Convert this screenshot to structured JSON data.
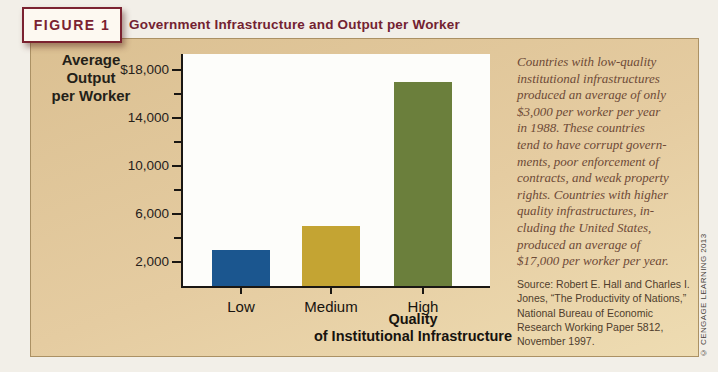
{
  "header": {
    "badge": "FIGURE 1",
    "title": "Government Infrastructure and Output per Worker"
  },
  "chart_data": {
    "type": "bar",
    "title": "Government Infrastructure and Output per Worker",
    "categories": [
      "Low",
      "Medium",
      "High"
    ],
    "values": [
      3000,
      5000,
      17000
    ],
    "bar_colors": [
      "#1b568f",
      "#c4a433",
      "#6b7f3c"
    ],
    "ylabel": "Average Output per Worker",
    "ylabel_lines": [
      "Average",
      "Output",
      "per Worker"
    ],
    "xlabel": "Quality of Institutional Infrastructure",
    "xlabel_lines": [
      "Quality",
      "of Institutional Infrastructure"
    ],
    "ylim": [
      0,
      19300
    ],
    "yticks_major": [
      18000,
      14000,
      10000,
      6000,
      2000
    ],
    "ytick_labels": [
      "$18,000",
      "14,000",
      "10,000",
      "6,000",
      "2,000"
    ],
    "yticks_minor": [
      16000,
      12000,
      8000,
      4000
    ],
    "grid": false,
    "legend": "none"
  },
  "note": {
    "lines": [
      "Countries with low-quality",
      "institutional infrastructures",
      "produced an average of only",
      "$3,000 per worker per year",
      "in 1988. These countries",
      "tend to have corrupt govern-",
      "ments, poor enforcement of",
      "contracts, and weak property",
      "rights. Countries with higher",
      "quality infrastructures, in-",
      "cluding the United States,",
      "produced an average of",
      "$17,000 per worker per year."
    ]
  },
  "source": {
    "lines": [
      "Source: Robert E. Hall and Charles I.",
      "Jones, “The Productivity of Nations,”",
      "National Bureau of Economic",
      "Research Working Paper 5812,",
      "November 1997."
    ]
  },
  "copyright": "© CENGAGE LEARNING 2013",
  "colors": {
    "accent_maroon": "#7b2230",
    "panel_tan": "#e3c99c",
    "bar_blue": "#1b568f",
    "bar_gold": "#c4a433",
    "bar_green": "#6b7f3c",
    "plot_background": "#fdfdfa"
  }
}
